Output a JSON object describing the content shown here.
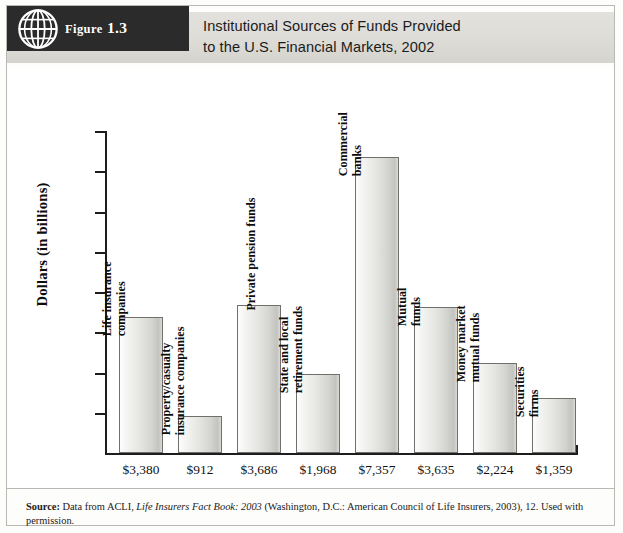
{
  "figure": {
    "badge_prefix": "Figure",
    "badge_number": "1.3",
    "icon": "globe-icon",
    "title_line1": "Institutional Sources of Funds Provided",
    "title_line2": "to the U.S. Financial Markets, 2002"
  },
  "source": {
    "label": "Source:",
    "text_before_italic": " Data from ACLI, ",
    "italic": "Life Insurers Fact Book: 2003",
    "text_after_italic": " (Washington, D.C.: American Council of Life Insurers, 2003), 12. Used with permission."
  },
  "colors": {
    "badge_background": "#2b2b2b",
    "title_band": "#dddcd7",
    "bar_fill_light": "#fdfdfd",
    "bar_fill_dark": "#c3c3bf",
    "bar_border": "#6f6f6c",
    "axis": "#1d1d1d",
    "frame": "#b9b9b4",
    "text": "#111111"
  },
  "chart_data": {
    "type": "bar",
    "title": "Institutional Sources of Funds Provided to the U.S. Financial Markets, 2002",
    "xlabel": "",
    "ylabel": "Dollars (in billions)",
    "ylim": [
      0,
      8000
    ],
    "ytick_step": 1000,
    "grid": false,
    "legend": "none",
    "ytick_labels": [
      "0",
      "1,000",
      "2,000",
      "3,000",
      "4,000",
      "5,000",
      "6,000",
      "7,000",
      "8,000"
    ],
    "categories": [
      "Life insurance companies",
      "Property/casualty insurance companies",
      "Private pension funds",
      "State and local retirement funds",
      "Commercial banks",
      "Mutual funds",
      "Money market mutual funds",
      "Securities firms"
    ],
    "category_lines": [
      [
        "Life insurance",
        "companies"
      ],
      [
        "Property/casualty",
        "insurance companies"
      ],
      [
        "Private pension funds"
      ],
      [
        "State and local",
        "retirement funds"
      ],
      [
        "Commercial",
        "banks"
      ],
      [
        "Mutual",
        "funds"
      ],
      [
        "Money market",
        "mutual funds"
      ],
      [
        "Securities",
        "firms"
      ]
    ],
    "values": [
      3380,
      912,
      3686,
      1968,
      7357,
      3635,
      2224,
      1359
    ],
    "value_labels": [
      "$3,380",
      "$912",
      "$3,686",
      "$1,968",
      "$7,357",
      "$3,635",
      "$2,224",
      "$1,359"
    ]
  }
}
